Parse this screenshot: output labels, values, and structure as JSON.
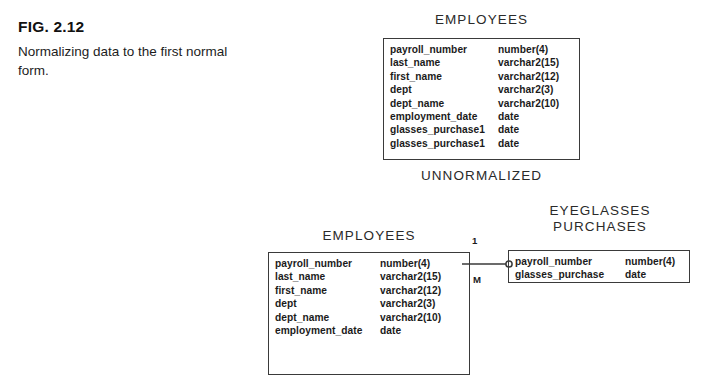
{
  "caption": {
    "figure_label": "FIG. 2.12",
    "description": "Normalizing data to the first normal form."
  },
  "diagram": {
    "unnormalized": {
      "title": "EMPLOYEES",
      "section_label": "UNNORMALIZED",
      "attributes": [
        {
          "name": "payroll_number",
          "type": "number(4)"
        },
        {
          "name": "last_name",
          "type": "varchar2(15)"
        },
        {
          "name": "first_name",
          "type": "varchar2(12)"
        },
        {
          "name": "dept",
          "type": "varchar2(3)"
        },
        {
          "name": "dept_name",
          "type": "varchar2(10)"
        },
        {
          "name": "employment_date",
          "type": "date"
        },
        {
          "name": "glasses_purchase1",
          "type": "date"
        },
        {
          "name": "glasses_purchase1",
          "type": "date"
        }
      ]
    },
    "employees": {
      "title": "EMPLOYEES",
      "attributes": [
        {
          "name": "payroll_number",
          "type": "number(4)"
        },
        {
          "name": "last_name",
          "type": "varchar2(15)"
        },
        {
          "name": "first_name",
          "type": "varchar2(12)"
        },
        {
          "name": "dept",
          "type": "varchar2(3)"
        },
        {
          "name": "dept_name",
          "type": "varchar2(10)"
        },
        {
          "name": "employment_date",
          "type": "date"
        }
      ]
    },
    "purchases": {
      "title": "EYEGLASSES\nPURCHASES",
      "attributes": [
        {
          "name": "payroll_number",
          "type": "number(4)"
        },
        {
          "name": "glasses_purchase",
          "type": "date"
        }
      ]
    },
    "relationship": {
      "cardinality_one": "1",
      "cardinality_many": "M",
      "optionality_symbol": "0"
    }
  },
  "colors": {
    "ink": "#1b1b1b",
    "border": "#3a3a3a",
    "background": "#ffffff"
  }
}
